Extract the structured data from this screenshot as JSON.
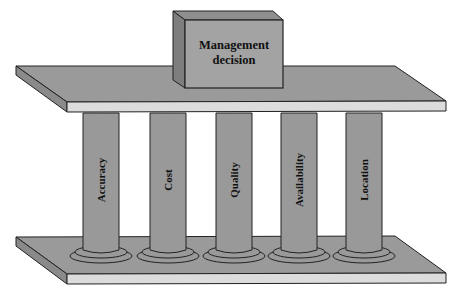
{
  "diagram": {
    "top_box": {
      "line1": "Management",
      "line2": "decision"
    },
    "pillars": [
      {
        "label": "Accuracy"
      },
      {
        "label": "Cost"
      },
      {
        "label": "Quality"
      },
      {
        "label": "Availability"
      },
      {
        "label": "Location"
      }
    ],
    "colors": {
      "slab_top": "#9a9a9a",
      "slab_front": "#dcdcdc",
      "slab_side": "#8a8a8a",
      "pillar": "#999999",
      "box_front": "#a3a3a3",
      "box_side": "#7e7e7e",
      "stroke": "#222222"
    }
  }
}
